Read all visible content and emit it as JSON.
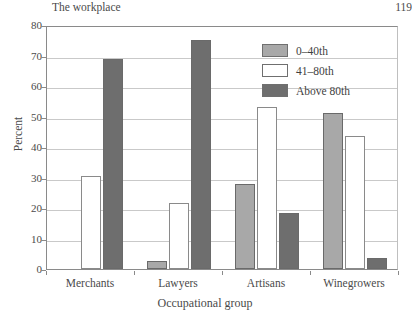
{
  "header": {
    "running_title": "The workplace",
    "page_number": "119"
  },
  "chart_data": {
    "type": "bar",
    "title": "",
    "xlabel": "Occupational group",
    "ylabel": "Percent",
    "ylim": [
      0,
      80
    ],
    "yticks": [
      0,
      10,
      20,
      30,
      40,
      50,
      60,
      70,
      80
    ],
    "ytick_labels": [
      "0",
      "10",
      "20",
      "30",
      "40",
      "50",
      "60",
      "70",
      "80"
    ],
    "grid": true,
    "legend_position": "top-right",
    "categories": [
      "Merchants",
      "Lawyers",
      "Artisans",
      "Winegrowers"
    ],
    "series": [
      {
        "name": "0–40th",
        "color": "#a8a8a8",
        "values": [
          0,
          2.5,
          28,
          51
        ]
      },
      {
        "name": "41–80th",
        "color": "#ffffff",
        "values": [
          30.5,
          21.5,
          53,
          43.5
        ]
      },
      {
        "name": "Above 80th",
        "color": "#6e6e6e",
        "values": [
          69,
          75,
          18.5,
          3.5
        ]
      }
    ]
  }
}
